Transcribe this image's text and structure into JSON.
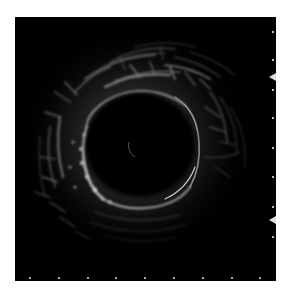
{
  "image": {
    "description": "Intravascular ultrasound cross-sectional image of a vessel",
    "background_color": "#000000",
    "page_background": "#ffffff",
    "frame": {
      "x": 15,
      "y": 17,
      "width": 261,
      "height": 264
    },
    "lumen": {
      "cx": 125,
      "cy": 128,
      "rx": 56,
      "ry": 54,
      "color": "#000000"
    },
    "catheter_artifact": {
      "cx": 118,
      "cy": 133
    },
    "right_scale_ticks_y": [
      15,
      43,
      73,
      101,
      131,
      160,
      190,
      220
    ],
    "right_scale_markers_y": [
      60,
      203
    ],
    "bottom_scale_ticks_x": [
      15,
      44,
      73,
      101,
      130,
      159,
      188,
      217,
      245
    ],
    "speckle_color": "#d8d8d8"
  },
  "caption": {
    "text": "",
    "color": "#efefef"
  }
}
